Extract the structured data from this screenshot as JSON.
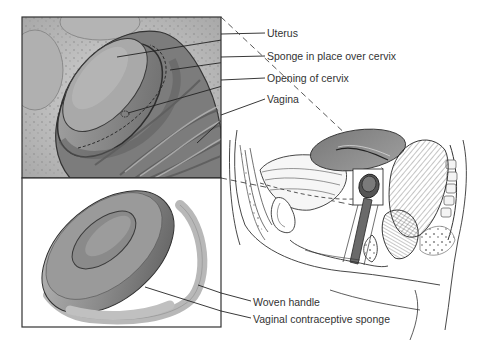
{
  "diagram": {
    "type": "anatomical-illustration",
    "colors": {
      "background": "#ffffff",
      "outline": "#333333",
      "tissue_dark": "#6e6e6e",
      "tissue_mid": "#9a9a9a",
      "tissue_light": "#c8c8c8",
      "label_text": "#333333"
    },
    "panels": [
      {
        "id": "inset-top",
        "description": "Close-up of sponge in place over cervix inside vagina"
      },
      {
        "id": "inset-bottom",
        "description": "Sponge with woven handle"
      },
      {
        "id": "sagittal-view",
        "description": "Sagittal section of female pelvis with callout box at cervix"
      }
    ],
    "labels_top": [
      {
        "text": "Uterus"
      },
      {
        "text": "Sponge in place over cervix"
      },
      {
        "text": "Opening of cervix"
      },
      {
        "text": "Vagina"
      }
    ],
    "labels_bottom": [
      {
        "text": "Woven handle"
      },
      {
        "text": "Vaginal contraceptive sponge"
      }
    ]
  }
}
